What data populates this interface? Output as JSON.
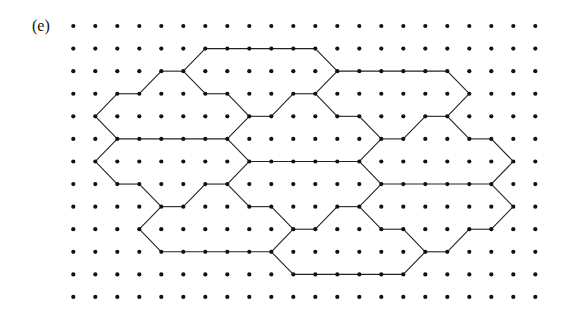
{
  "figure": {
    "label": "(e)",
    "colors": {
      "background": "#ffffff",
      "dot": "#111111",
      "line": "#222222"
    },
    "grid": {
      "columns": 22,
      "rows": 13,
      "origin_x": 73.3,
      "origin_y": 26,
      "spacing_x": 22,
      "spacing_y": 22.58,
      "dot_radius": 2.1
    },
    "edges": [
      [
        [
          6,
          1
        ],
        [
          11,
          1
        ]
      ],
      [
        [
          5,
          2
        ],
        [
          6,
          1
        ]
      ],
      [
        [
          4,
          2
        ],
        [
          5,
          2
        ]
      ],
      [
        [
          3,
          3
        ],
        [
          4,
          2
        ]
      ],
      [
        [
          2,
          3
        ],
        [
          3,
          3
        ]
      ],
      [
        [
          1,
          4
        ],
        [
          2,
          3
        ]
      ],
      [
        [
          1,
          4
        ],
        [
          2,
          5
        ]
      ],
      [
        [
          11,
          1
        ],
        [
          12,
          2
        ]
      ],
      [
        [
          12,
          2
        ],
        [
          17,
          2
        ]
      ],
      [
        [
          17,
          2
        ],
        [
          18,
          3
        ]
      ],
      [
        [
          18,
          3
        ],
        [
          17,
          4
        ]
      ],
      [
        [
          16,
          4
        ],
        [
          17,
          4
        ]
      ],
      [
        [
          15,
          5
        ],
        [
          16,
          4
        ]
      ],
      [
        [
          14,
          5
        ],
        [
          15,
          5
        ]
      ],
      [
        [
          13,
          4
        ],
        [
          14,
          5
        ]
      ],
      [
        [
          12,
          4
        ],
        [
          13,
          4
        ]
      ],
      [
        [
          11,
          3
        ],
        [
          12,
          4
        ]
      ],
      [
        [
          10,
          3
        ],
        [
          11,
          3
        ]
      ],
      [
        [
          11,
          3
        ],
        [
          12,
          2
        ]
      ],
      [
        [
          9,
          4
        ],
        [
          10,
          3
        ]
      ],
      [
        [
          5,
          2
        ],
        [
          6,
          3
        ]
      ],
      [
        [
          6,
          3
        ],
        [
          7,
          3
        ]
      ],
      [
        [
          7,
          3
        ],
        [
          8,
          4
        ]
      ],
      [
        [
          8,
          4
        ],
        [
          9,
          4
        ]
      ],
      [
        [
          2,
          5
        ],
        [
          7,
          5
        ]
      ],
      [
        [
          7,
          5
        ],
        [
          8,
          4
        ]
      ],
      [
        [
          7,
          5
        ],
        [
          8,
          6
        ]
      ],
      [
        [
          2,
          5
        ],
        [
          1,
          6
        ]
      ],
      [
        [
          1,
          6
        ],
        [
          2,
          7
        ]
      ],
      [
        [
          2,
          7
        ],
        [
          3,
          7
        ]
      ],
      [
        [
          3,
          7
        ],
        [
          4,
          8
        ]
      ],
      [
        [
          4,
          8
        ],
        [
          5,
          8
        ]
      ],
      [
        [
          5,
          8
        ],
        [
          6,
          7
        ]
      ],
      [
        [
          6,
          7
        ],
        [
          7,
          7
        ]
      ],
      [
        [
          7,
          7
        ],
        [
          8,
          6
        ]
      ],
      [
        [
          7,
          7
        ],
        [
          8,
          8
        ]
      ],
      [
        [
          8,
          8
        ],
        [
          9,
          8
        ]
      ],
      [
        [
          9,
          8
        ],
        [
          10,
          9
        ]
      ],
      [
        [
          8,
          6
        ],
        [
          13,
          6
        ]
      ],
      [
        [
          13,
          6
        ],
        [
          14,
          5
        ]
      ],
      [
        [
          13,
          6
        ],
        [
          14,
          7
        ]
      ],
      [
        [
          17,
          4
        ],
        [
          18,
          5
        ]
      ],
      [
        [
          18,
          5
        ],
        [
          19,
          5
        ]
      ],
      [
        [
          19,
          5
        ],
        [
          20,
          6
        ]
      ],
      [
        [
          20,
          6
        ],
        [
          19,
          7
        ]
      ],
      [
        [
          14,
          7
        ],
        [
          19,
          7
        ]
      ],
      [
        [
          19,
          7
        ],
        [
          20,
          8
        ]
      ],
      [
        [
          20,
          8
        ],
        [
          19,
          9
        ]
      ],
      [
        [
          18,
          9
        ],
        [
          19,
          9
        ]
      ],
      [
        [
          17,
          10
        ],
        [
          18,
          9
        ]
      ],
      [
        [
          16,
          10
        ],
        [
          17,
          10
        ]
      ],
      [
        [
          15,
          11
        ],
        [
          16,
          10
        ]
      ],
      [
        [
          15,
          9
        ],
        [
          16,
          10
        ]
      ],
      [
        [
          14,
          9
        ],
        [
          15,
          9
        ]
      ],
      [
        [
          13,
          8
        ],
        [
          14,
          9
        ]
      ],
      [
        [
          13,
          8
        ],
        [
          14,
          7
        ]
      ],
      [
        [
          12,
          8
        ],
        [
          13,
          8
        ]
      ],
      [
        [
          11,
          9
        ],
        [
          12,
          8
        ]
      ],
      [
        [
          10,
          9
        ],
        [
          11,
          9
        ]
      ],
      [
        [
          3,
          9
        ],
        [
          4,
          8
        ]
      ],
      [
        [
          3,
          9
        ],
        [
          4,
          10
        ]
      ],
      [
        [
          4,
          10
        ],
        [
          9,
          10
        ]
      ],
      [
        [
          9,
          10
        ],
        [
          10,
          9
        ]
      ],
      [
        [
          9,
          10
        ],
        [
          10,
          11
        ]
      ],
      [
        [
          10,
          11
        ],
        [
          15,
          11
        ]
      ]
    ]
  }
}
